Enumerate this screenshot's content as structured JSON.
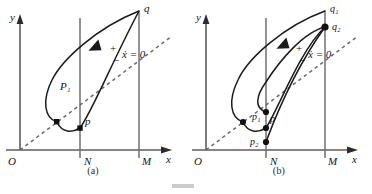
{
  "figure": {
    "type": "phase-plane-diagram",
    "ink_color": "#1a1a1a",
    "axis_color": "#5b5b5b",
    "dashed_color": "#6a6a6a",
    "panels": [
      {
        "id": "a",
        "caption": "(a)",
        "axes": {
          "x_label": "x",
          "y_label": "y",
          "origin_label": "O"
        },
        "vertical_lines": [
          {
            "name": "N",
            "label": "N"
          },
          {
            "name": "M",
            "label": "M"
          }
        ],
        "nullcline": {
          "label": "ẋ = 0",
          "sign_above": "+",
          "sign_below": "−"
        },
        "points": [
          {
            "label": "p",
            "marker": "square"
          },
          {
            "label": "",
            "marker": "square"
          },
          {
            "label": "q",
            "marker": "none"
          }
        ],
        "curve_labels": [
          {
            "label": "P₁"
          }
        ]
      },
      {
        "id": "b",
        "caption": "(b)",
        "axes": {
          "x_label": "x",
          "y_label": "y",
          "origin_label": "O"
        },
        "vertical_lines": [
          {
            "name": "N",
            "label": "N"
          },
          {
            "name": "M",
            "label": "M"
          }
        ],
        "nullcline": {
          "label": "ẋ = 0",
          "sign_above": "+",
          "sign_below": "−"
        },
        "points": [
          {
            "label": "p₁",
            "marker": "dot"
          },
          {
            "label": "p",
            "marker": "dot"
          },
          {
            "label": "p₂",
            "marker": "dot"
          },
          {
            "label": "q₁",
            "marker": "none"
          },
          {
            "label": "q₂",
            "marker": "dot"
          },
          {
            "label": "",
            "marker": "dot"
          }
        ]
      }
    ]
  }
}
